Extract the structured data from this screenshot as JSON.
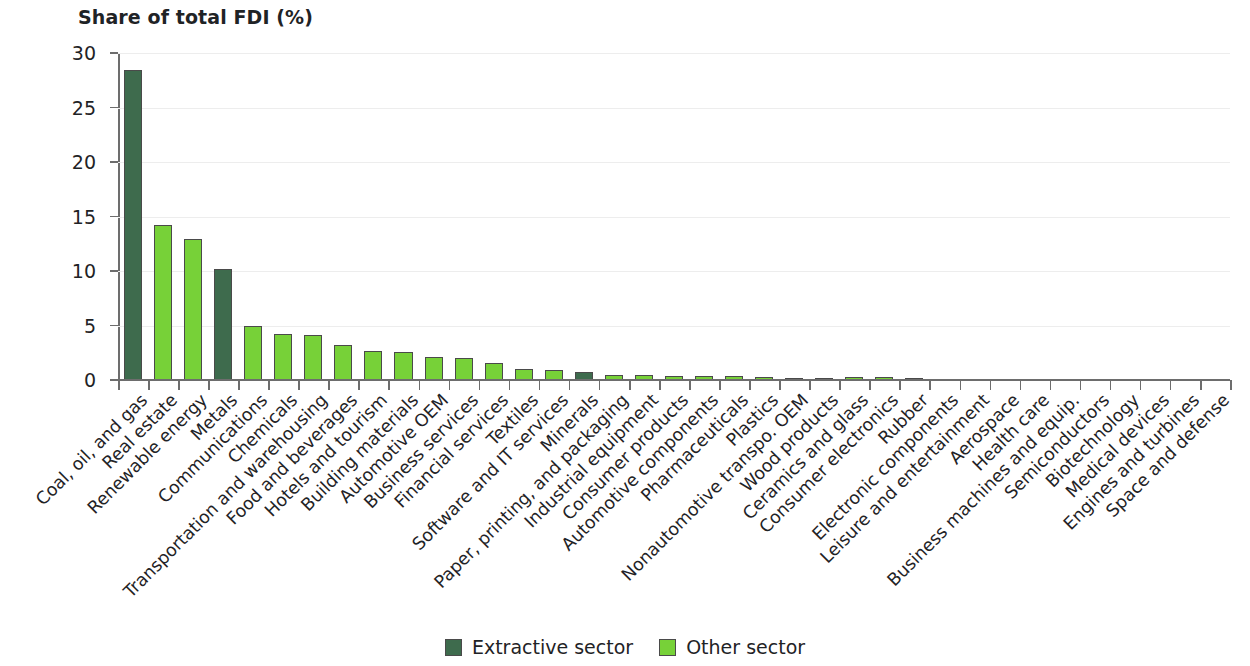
{
  "chart_data": {
    "type": "bar",
    "title": "Share of total FDI (%)",
    "xlabel": "",
    "ylabel": "Share of total FDI (%)",
    "ylim": [
      0,
      30
    ],
    "yticks": [
      0,
      5,
      10,
      15,
      20,
      25,
      30
    ],
    "grid": true,
    "legend_position": "bottom-center",
    "categories": [
      "Coal, oil, and gas",
      "Real estate",
      "Renewable energy",
      "Metals",
      "Communications",
      "Chemicals",
      "Transportation and warehousing",
      "Food and beverages",
      "Hotels and tourism",
      "Building materials",
      "Automotive OEM",
      "Business services",
      "Financial services",
      "Textiles",
      "Software and IT services",
      "Minerals",
      "Paper, printing, and packaging",
      "Industrial equipment",
      "Consumer products",
      "Automotive components",
      "Pharmaceuticals",
      "Plastics",
      "Nonautomotive transpo. OEM",
      "Wood products",
      "Ceramics and glass",
      "Consumer electronics",
      "Rubber",
      "Electronic components",
      "Leisure and entertainment",
      "Aerospace",
      "Health care",
      "Business machines and equip.",
      "Semiconductors",
      "Biotechnology",
      "Medical devices",
      "Engines and turbines",
      "Space and defense"
    ],
    "values": [
      28.4,
      14.2,
      12.9,
      10.2,
      5.0,
      4.2,
      4.1,
      3.2,
      2.7,
      2.6,
      2.1,
      2.0,
      1.6,
      1.0,
      0.9,
      0.7,
      0.5,
      0.5,
      0.4,
      0.4,
      0.35,
      0.3,
      0.22,
      0.22,
      0.25,
      0.25,
      0.2,
      0.13,
      0.13,
      0.1,
      0.08,
      0.06,
      0.03,
      0.02,
      0.02,
      0.01,
      0.01
    ],
    "series_of_point": [
      "extractive",
      "other",
      "other",
      "extractive",
      "other",
      "other",
      "other",
      "other",
      "other",
      "other",
      "other",
      "other",
      "other",
      "other",
      "other",
      "extractive",
      "other",
      "other",
      "other",
      "other",
      "other",
      "other",
      "other",
      "other",
      "other",
      "other",
      "other",
      "other",
      "other",
      "other",
      "other",
      "other",
      "other",
      "other",
      "other",
      "other",
      "other"
    ],
    "legend": [
      {
        "key": "extractive",
        "label": "Extractive sector",
        "color": "#3e6b4d"
      },
      {
        "key": "other",
        "label": "Other sector",
        "color": "#77d138"
      }
    ]
  }
}
